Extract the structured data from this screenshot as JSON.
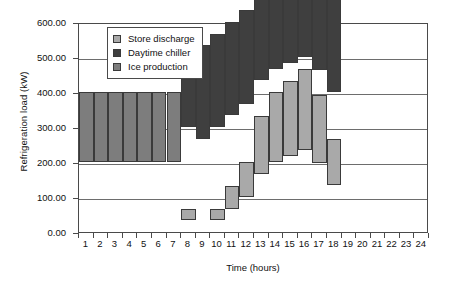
{
  "chart_data": {
    "type": "bar",
    "stacked": true,
    "title": "",
    "xlabel": "Time (hours)",
    "ylabel": "Refrigeration load (kW)",
    "xlim": [
      0,
      24
    ],
    "ylim": [
      0,
      600
    ],
    "ytick_labels": [
      "0.00",
      "100.00",
      "200.00",
      "300.00",
      "400.00",
      "500.00",
      "600.00"
    ],
    "ytick_values": [
      0,
      100,
      200,
      300,
      400,
      500,
      600
    ],
    "grid": "horizontal",
    "legend_position": "upper-left-inside",
    "categories": [
      1,
      2,
      3,
      4,
      5,
      6,
      7,
      8,
      9,
      10,
      11,
      12,
      13,
      14,
      15,
      16,
      17,
      18,
      19,
      20,
      21,
      22,
      23,
      24
    ],
    "xtick_labels": [
      "1",
      "2",
      "3",
      "4",
      "5",
      "6",
      "7",
      "8",
      "9",
      "10",
      "11",
      "12",
      "13",
      "14",
      "15",
      "16",
      "17",
      "18",
      "19",
      "20",
      "21",
      "22",
      "23",
      "24"
    ],
    "series": [
      {
        "name": "Ice production",
        "color": "#7d7d7d",
        "values": [
          200,
          200,
          200,
          200,
          200,
          200,
          200,
          0,
          0,
          0,
          0,
          0,
          0,
          0,
          0,
          0,
          0,
          0,
          0,
          0,
          0,
          0,
          0,
          0
        ]
      },
      {
        "name": "Daytime chiller",
        "color": "#3f3f3f",
        "values": [
          0,
          0,
          0,
          0,
          0,
          0,
          0,
          267,
          267,
          267,
          267,
          267,
          267,
          267,
          267,
          267,
          267,
          267,
          0,
          0,
          0,
          0,
          0,
          0
        ]
      },
      {
        "name": "Store discharge",
        "color": "#a9a9a9",
        "values": [
          0,
          0,
          0,
          0,
          0,
          0,
          0,
          33,
          0,
          33,
          66,
          100,
          166,
          200,
          216,
          233,
          196,
          133,
          0,
          0,
          0,
          0,
          0,
          0
        ]
      }
    ],
    "totals": [
      200,
      200,
      200,
      200,
      200,
      200,
      200,
      300,
      267,
      300,
      333,
      367,
      433,
      467,
      483,
      500,
      463,
      400,
      0,
      0,
      0,
      0,
      0,
      0
    ]
  },
  "legend": {
    "items": [
      {
        "label": "Store discharge",
        "color": "#a9a9a9"
      },
      {
        "label": "Daytime chiller",
        "color": "#3f3f3f"
      },
      {
        "label": "Ice production",
        "color": "#7d7d7d"
      }
    ]
  },
  "colors": {
    "axis": "#4a4a4a",
    "grid": "#6d6d6d",
    "bar_edge": "#3a3a3a",
    "background": "#ffffff"
  }
}
